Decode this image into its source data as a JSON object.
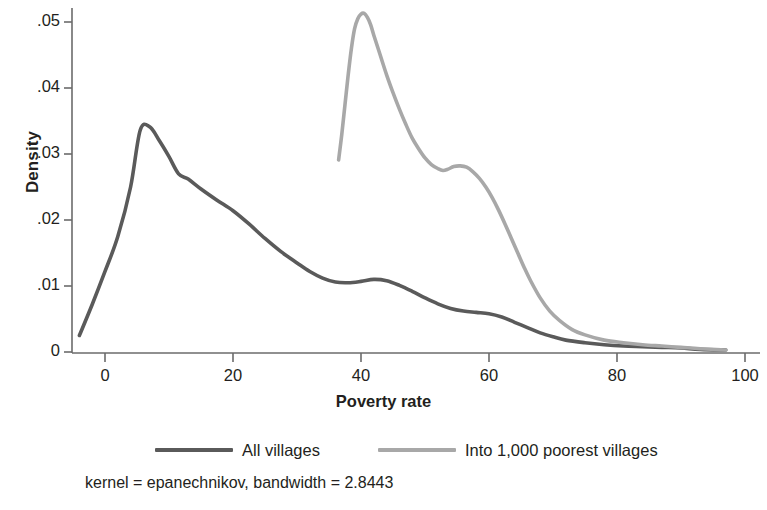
{
  "chart_data": {
    "type": "line",
    "title": "",
    "xlabel": "Poverty rate",
    "ylabel": "Density",
    "xlim": [
      -5,
      100
    ],
    "ylim": [
      0,
      0.053
    ],
    "grid": false,
    "legend_position": "bottom",
    "xticks": [
      "0",
      "20",
      "40",
      "60",
      "80",
      "100"
    ],
    "xtick_values": [
      0,
      20,
      40,
      60,
      80,
      100
    ],
    "yticks": [
      "0",
      ".01",
      ".02",
      ".03",
      ".04",
      ".05"
    ],
    "ytick_values": [
      0,
      0.01,
      0.02,
      0.03,
      0.04,
      0.05
    ],
    "annotation": "kernel = epanechnikov, bandwidth = 2.8443",
    "series": [
      {
        "name": "All villages",
        "color": "#5a5a5a",
        "x": [
          -4.0,
          -2.0,
          0.0,
          2.0,
          4.0,
          5.5,
          7.0,
          8.5,
          10.0,
          11.5,
          13.0,
          15.0,
          17.5,
          20.0,
          22.5,
          25.0,
          27.5,
          30.0,
          32.0,
          34.0,
          36.0,
          38.0,
          40.0,
          42.0,
          44.0,
          46.0,
          48.0,
          50.0,
          52.0,
          54.0,
          56.0,
          58.0,
          60.0,
          62.0,
          64.0,
          66.0,
          68.0,
          70.0,
          72.0,
          75.0,
          78.0,
          81.0,
          84.0,
          87.0,
          90.0,
          93.0,
          97.0
        ],
        "y": [
          0.0025,
          0.0072,
          0.0122,
          0.0175,
          0.025,
          0.0336,
          0.0341,
          0.032,
          0.0296,
          0.027,
          0.0262,
          0.0247,
          0.023,
          0.0214,
          0.0194,
          0.0172,
          0.0152,
          0.0135,
          0.0122,
          0.0112,
          0.0106,
          0.0105,
          0.0107,
          0.011,
          0.0108,
          0.0101,
          0.0092,
          0.0082,
          0.0073,
          0.0066,
          0.0062,
          0.006,
          0.0058,
          0.0053,
          0.0045,
          0.0037,
          0.0029,
          0.0023,
          0.0018,
          0.0014,
          0.0011,
          0.0009,
          0.0008,
          0.0007,
          0.0006,
          0.0004,
          0.0003
        ]
      },
      {
        "name": "Into 1,000 poorest villages",
        "color": "#a8a8a8",
        "x": [
          36.5,
          37.0,
          37.5,
          38.0,
          38.5,
          39.0,
          39.5,
          40.0,
          40.5,
          41.0,
          41.5,
          42.0,
          43.0,
          44.0,
          45.0,
          46.0,
          47.0,
          48.0,
          49.0,
          50.0,
          51.0,
          52.0,
          52.8,
          53.6,
          54.5,
          55.5,
          56.5,
          57.5,
          58.5,
          59.5,
          60.5,
          61.5,
          62.5,
          63.5,
          64.5,
          65.5,
          66.5,
          68.0,
          69.5,
          71.0,
          73.0,
          75.0,
          78.0,
          81.0,
          84.0,
          87.0,
          90.0,
          93.0,
          97.0
        ],
        "y": [
          0.0291,
          0.033,
          0.0375,
          0.042,
          0.046,
          0.049,
          0.0505,
          0.0512,
          0.0513,
          0.0507,
          0.0496,
          0.048,
          0.045,
          0.042,
          0.0393,
          0.0368,
          0.0345,
          0.0324,
          0.0308,
          0.0294,
          0.0284,
          0.0278,
          0.0275,
          0.0277,
          0.0281,
          0.0282,
          0.028,
          0.0273,
          0.0263,
          0.025,
          0.0234,
          0.0215,
          0.0194,
          0.0172,
          0.015,
          0.0128,
          0.0108,
          0.0082,
          0.0062,
          0.0048,
          0.0034,
          0.0026,
          0.0018,
          0.0014,
          0.0011,
          0.0009,
          0.0007,
          0.0005,
          0.0003
        ]
      }
    ]
  },
  "axes": {
    "ylabel": "Density",
    "xlabel": "Poverty rate",
    "ytick_labels": [
      "0",
      ".01",
      ".02",
      ".03",
      ".04",
      ".05"
    ],
    "xtick_labels": [
      "0",
      "20",
      "40",
      "60",
      "80",
      "100"
    ]
  },
  "legend": {
    "items": [
      {
        "label": "All villages",
        "color": "#5a5a5a"
      },
      {
        "label": "Into 1,000 poorest villages",
        "color": "#a8a8a8"
      }
    ]
  },
  "footnote": {
    "text": "kernel = epanechnikov, bandwidth = 2.8443"
  },
  "colors": {
    "axis": "#6b6b6b",
    "text": "#231f20",
    "series_dark": "#5a5a5a",
    "series_light": "#a8a8a8",
    "background": "#ffffff"
  }
}
